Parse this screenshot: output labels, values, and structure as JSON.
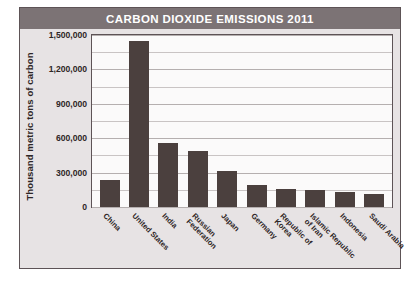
{
  "chart_data": {
    "type": "bar",
    "title": "CARBON DIOXIDE EMISSIONS 2011",
    "xlabel": "",
    "ylabel": "Thousand metric tons of carbon",
    "categories": [
      "China",
      "United States",
      "India",
      "Russian Federation",
      "Japan",
      "Germany",
      "Republic of Korea",
      "Islamic Republic of Iran",
      "Indonesia",
      "Saudi Arabia"
    ],
    "category_lines": [
      [
        "China"
      ],
      [
        "United States"
      ],
      [
        "India"
      ],
      [
        "Russian",
        "Federation"
      ],
      [
        "Japan"
      ],
      [
        "Germany"
      ],
      [
        "Republic of",
        "Korea"
      ],
      [
        "Islamic Republic",
        "of Iran"
      ],
      [
        "Indonesia"
      ],
      [
        "Saudi Arabia"
      ]
    ],
    "values": [
      235000,
      1450000,
      560000,
      490000,
      310000,
      190000,
      160000,
      150000,
      130000,
      115000
    ],
    "ylim": [
      0,
      1500000
    ],
    "ytick_values": [
      0,
      300000,
      600000,
      900000,
      1200000,
      1500000
    ],
    "ytick_labels": [
      "0",
      "300,000",
      "600,000",
      "900,000",
      "1,200,000",
      "1,500,000"
    ],
    "gridline_interval": 150000,
    "grid": true,
    "legend": "none",
    "colors": {
      "bar": "#4b403e",
      "title_bar": "#7c7375",
      "title_text": "#ffffff",
      "card_background": "#e7e3e4",
      "plot_background": "#fbfafa",
      "border": "#5d5356",
      "gridline": "#c9c4c4",
      "axis_text": "#2e2626"
    }
  }
}
